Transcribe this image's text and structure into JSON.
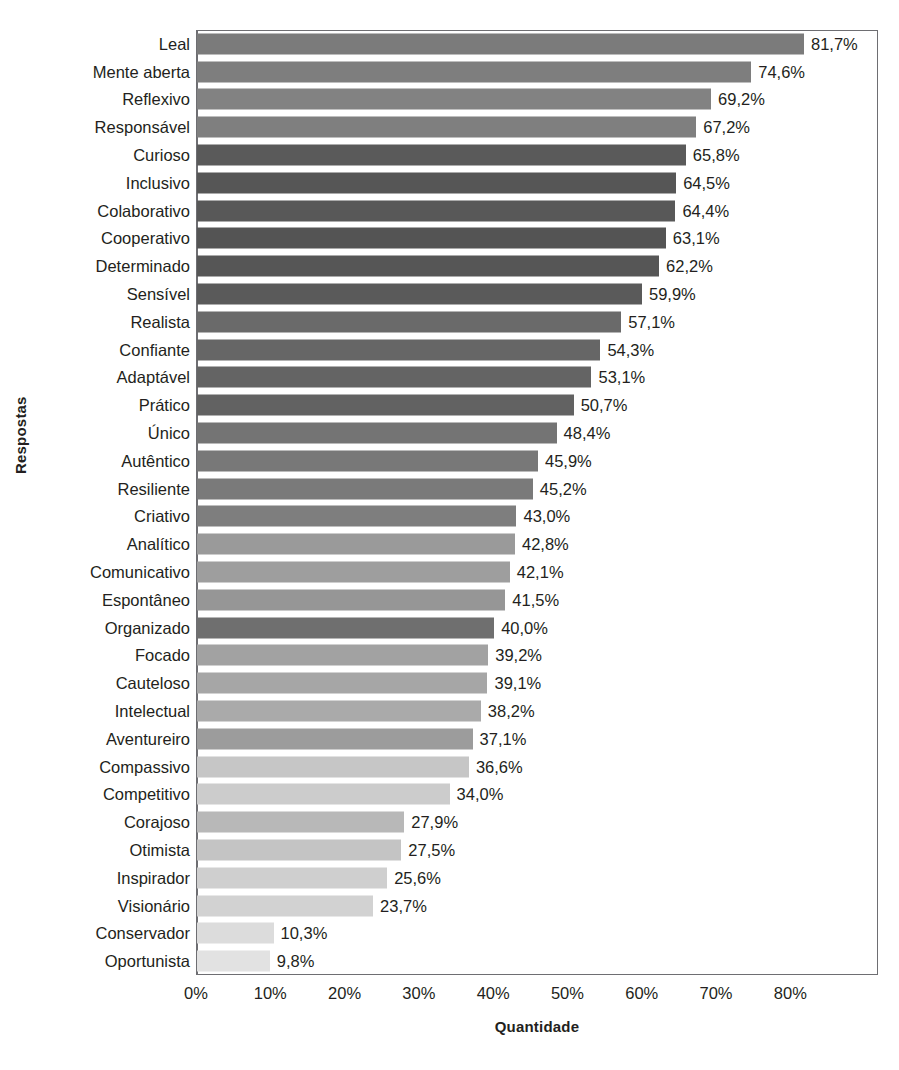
{
  "chart_data": {
    "type": "bar",
    "orientation": "horizontal",
    "title": "",
    "xlabel": "Quantidade",
    "ylabel": "Respostas",
    "xlim": [
      0,
      91.8
    ],
    "xticks": [
      "0%",
      "10%",
      "20%",
      "30%",
      "40%",
      "50%",
      "60%",
      "70%",
      "80%"
    ],
    "xtick_values": [
      0,
      10,
      20,
      30,
      40,
      50,
      60,
      70,
      80
    ],
    "grid": false,
    "legend": null,
    "value_label_format": "comma-decimal-percent",
    "categories": [
      "Leal",
      "Mente aberta",
      "Reflexivo",
      "Responsável",
      "Curioso",
      "Inclusivo",
      "Colaborativo",
      "Cooperativo",
      "Determinado",
      "Sensível",
      "Realista",
      "Confiante",
      "Adaptável",
      "Prático",
      "Único",
      "Autêntico",
      "Resiliente",
      "Criativo",
      "Analítico",
      "Comunicativo",
      "Espontâneo",
      "Organizado",
      "Focado",
      "Cauteloso",
      "Intelectual",
      "Aventureiro",
      "Compassivo",
      "Competitivo",
      "Corajoso",
      "Otimista",
      "Inspirador",
      "Visionário",
      "Conservador",
      "Oportunista"
    ],
    "values": [
      81.7,
      74.6,
      69.2,
      67.2,
      65.8,
      64.5,
      64.4,
      63.1,
      62.2,
      59.9,
      57.1,
      54.3,
      53.1,
      50.7,
      48.4,
      45.9,
      45.2,
      43.0,
      42.8,
      42.1,
      41.5,
      40.0,
      39.2,
      39.1,
      38.2,
      37.1,
      36.6,
      34.0,
      27.9,
      27.5,
      25.6,
      23.7,
      10.3,
      9.8
    ],
    "value_labels": [
      "81,7%",
      "74,6%",
      "69,2%",
      "67,2%",
      "65,8%",
      "64,5%",
      "64,4%",
      "63,1%",
      "62,2%",
      "59,9%",
      "57,1%",
      "54,3%",
      "53,1%",
      "50,7%",
      "48,4%",
      "45,9%",
      "45,2%",
      "43,0%",
      "42,8%",
      "42,1%",
      "41,5%",
      "40,0%",
      "39,2%",
      "39,1%",
      "38,2%",
      "37,1%",
      "36,6%",
      "34,0%",
      "27,9%",
      "27,5%",
      "25,6%",
      "23,7%",
      "10,3%",
      "9,8%"
    ],
    "bar_colors": [
      "#7b7b7b",
      "#7e7e7e",
      "#828282",
      "#7f7f7f",
      "#5a5a5a",
      "#565656",
      "#585858",
      "#545454",
      "#565656",
      "#5a5a5a",
      "#6a6a6a",
      "#666666",
      "#646464",
      "#626262",
      "#747474",
      "#787878",
      "#7a7a7a",
      "#7e7e7e",
      "#9a9a9a",
      "#9e9e9e",
      "#969696",
      "#6f6f6f",
      "#a2a2a2",
      "#a6a6a6",
      "#aaaaaa",
      "#9c9c9c",
      "#c6c6c6",
      "#cccccc",
      "#b8b8b8",
      "#c4c4c4",
      "#cfcfcf",
      "#d2d2d2",
      "#dcdcdc",
      "#e2e2e2"
    ]
  },
  "axis": {
    "x_title": "Quantidade",
    "y_title": "Respostas"
  },
  "colors": {
    "frame": "#6e6e72",
    "text": "#231f20",
    "background": "#ffffff"
  }
}
